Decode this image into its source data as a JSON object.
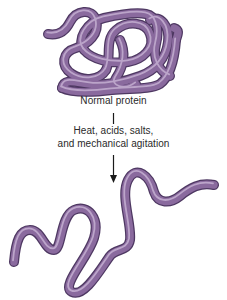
{
  "diagram": {
    "top_state": {
      "label": "Normal protein",
      "shape": "coiled-folded-strand"
    },
    "transition": {
      "line1": "Heat, acids, salts,",
      "line2": "and mechanical agitation",
      "arrow_direction": "down"
    },
    "bottom_state": {
      "label": "",
      "shape": "unfolded-wavy-strand"
    },
    "colors": {
      "strand_main": "#8a6a9e",
      "strand_dark": "#5e4472",
      "strand_light": "#b9a0c8",
      "text": "#2a2a2a",
      "arrow": "#1a1a1a",
      "background": "#ffffff"
    }
  }
}
